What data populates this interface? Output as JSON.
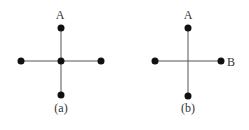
{
  "figures": [
    {
      "caption": "(a)",
      "nodes": [
        {
          "id": "top",
          "label": "A"
        },
        {
          "id": "center",
          "label": ""
        },
        {
          "id": "left",
          "label": ""
        },
        {
          "id": "right",
          "label": ""
        },
        {
          "id": "bottom",
          "label": ""
        }
      ],
      "edges": [
        [
          "center",
          "top"
        ],
        [
          "center",
          "bottom"
        ],
        [
          "center",
          "left"
        ],
        [
          "center",
          "right"
        ]
      ]
    },
    {
      "caption": "(b)",
      "nodes": [
        {
          "id": "top",
          "label": "A"
        },
        {
          "id": "left",
          "label": ""
        },
        {
          "id": "right",
          "label": "B"
        },
        {
          "id": "bottom",
          "label": ""
        }
      ],
      "edges": [
        [
          "top",
          "bottom"
        ],
        [
          "left",
          "right"
        ]
      ],
      "note": "crossing segments with no node at intersection"
    }
  ],
  "colors": {
    "node": "#111111",
    "edge": "#555555",
    "text": "#333333"
  }
}
